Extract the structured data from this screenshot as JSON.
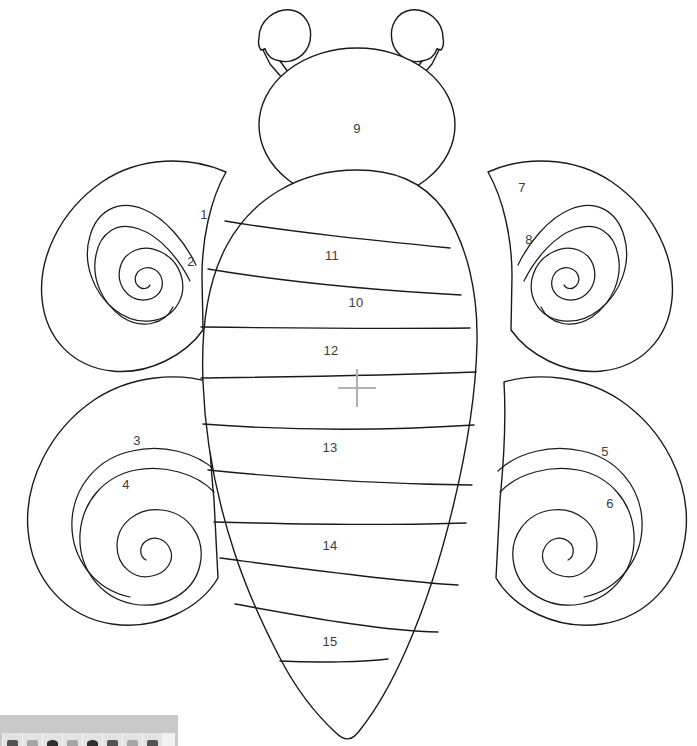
{
  "artwork": {
    "title": "Bee pattern line drawing",
    "subject": "bee",
    "style": "coloring-template",
    "background_color": "#ffffff",
    "stroke_color": "#1a1a1a",
    "label_color": "#3b3b3b",
    "registration_mark_color": "#b0b0b0"
  },
  "labels": {
    "wing_upper_left_outer": "1",
    "wing_upper_left_inner": "2",
    "wing_lower_left_outer": "3",
    "wing_lower_left_inner": "4",
    "wing_lower_right_outer": "5",
    "wing_lower_right_inner": "6",
    "wing_upper_right_outer": "7",
    "wing_upper_right_inner": "8",
    "head": "9",
    "body_stripe_2": "10",
    "body_stripe_1": "11",
    "body_stripe_3": "12",
    "body_stripe_4": "13",
    "body_stripe_5": "14",
    "body_stripe_6": "15"
  },
  "numbered_regions": [
    {
      "number": "1",
      "part": "upper-left wing outer field",
      "x": 204,
      "y": 215
    },
    {
      "number": "2",
      "part": "upper-left wing spiral band",
      "x": 191,
      "y": 262
    },
    {
      "number": "3",
      "part": "lower-left wing outer field",
      "x": 137,
      "y": 441
    },
    {
      "number": "4",
      "part": "lower-left wing spiral band",
      "x": 126,
      "y": 485
    },
    {
      "number": "5",
      "part": "lower-right wing outer field",
      "x": 605,
      "y": 452
    },
    {
      "number": "6",
      "part": "lower-right wing spiral band",
      "x": 610,
      "y": 504
    },
    {
      "number": "7",
      "part": "upper-right wing outer field",
      "x": 522,
      "y": 188
    },
    {
      "number": "8",
      "part": "upper-right wing spiral band",
      "x": 529,
      "y": 240
    },
    {
      "number": "9",
      "part": "head",
      "x": 357,
      "y": 129
    },
    {
      "number": "10",
      "part": "abdomen stripe two",
      "x": 356,
      "y": 303
    },
    {
      "number": "11",
      "part": "abdomen stripe one",
      "x": 332,
      "y": 256
    },
    {
      "number": "12",
      "part": "abdomen stripe three",
      "x": 331,
      "y": 351
    },
    {
      "number": "13",
      "part": "abdomen stripe four",
      "x": 330,
      "y": 448
    },
    {
      "number": "14",
      "part": "abdomen stripe five",
      "x": 330,
      "y": 546
    },
    {
      "number": "15",
      "part": "abdomen stripe six",
      "x": 330,
      "y": 642
    }
  ],
  "registration_mark": {
    "name": "center-crosshair",
    "x": 357,
    "y": 388,
    "arm_length": 19
  },
  "toolbar": {
    "visible": true,
    "note": "partially cropped toolbar strip at bottom-left",
    "background_color": "#c9c9c9",
    "cell_count": 8
  }
}
